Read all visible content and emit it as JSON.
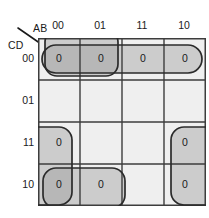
{
  "diagram": {
    "type": "karnaugh-map",
    "size": "4x4",
    "corner": {
      "column_variables": "AB",
      "row_variables": "CD"
    },
    "column_headers": [
      "00",
      "01",
      "11",
      "10"
    ],
    "row_headers": [
      "00",
      "01",
      "11",
      "10"
    ],
    "cells": [
      {
        "row": "00",
        "col": "00",
        "value": "0",
        "shade": "dark"
      },
      {
        "row": "00",
        "col": "01",
        "value": "0",
        "shade": "dark"
      },
      {
        "row": "00",
        "col": "11",
        "value": "0",
        "shade": "light"
      },
      {
        "row": "00",
        "col": "10",
        "value": "0",
        "shade": "light"
      },
      {
        "row": "01",
        "col": "00",
        "value": "",
        "shade": "none"
      },
      {
        "row": "01",
        "col": "01",
        "value": "",
        "shade": "none"
      },
      {
        "row": "01",
        "col": "11",
        "value": "",
        "shade": "none"
      },
      {
        "row": "01",
        "col": "10",
        "value": "",
        "shade": "none"
      },
      {
        "row": "11",
        "col": "00",
        "value": "0",
        "shade": "light"
      },
      {
        "row": "11",
        "col": "01",
        "value": "",
        "shade": "none"
      },
      {
        "row": "11",
        "col": "11",
        "value": "",
        "shade": "none"
      },
      {
        "row": "11",
        "col": "10",
        "value": "0",
        "shade": "light"
      },
      {
        "row": "10",
        "col": "00",
        "value": "0",
        "shade": "dark"
      },
      {
        "row": "10",
        "col": "01",
        "value": "0",
        "shade": "light"
      },
      {
        "row": "10",
        "col": "11",
        "value": "",
        "shade": "none"
      },
      {
        "row": "10",
        "col": "10",
        "value": "0",
        "shade": "light"
      }
    ],
    "groups": [
      {
        "id": "group-row00-all",
        "orientation": "horizontal",
        "row": "00",
        "cols": [
          "00",
          "01",
          "11",
          "10"
        ],
        "size": 4
      },
      {
        "id": "group-row00-left",
        "orientation": "horizontal",
        "row": "00",
        "cols": [
          "00",
          "01"
        ],
        "size": 2
      },
      {
        "id": "group-col00-bottom",
        "orientation": "vertical",
        "col": "00",
        "rows": [
          "11",
          "10"
        ],
        "size": 2,
        "wraps_edge": "left"
      },
      {
        "id": "group-row10-left",
        "orientation": "horizontal",
        "row": "10",
        "cols": [
          "00",
          "01"
        ],
        "size": 2
      },
      {
        "id": "group-col10-bottom",
        "orientation": "vertical",
        "col": "10",
        "rows": [
          "11",
          "10"
        ],
        "size": 2,
        "wraps_edge": "right"
      }
    ],
    "colors": {
      "cell_empty": "#efefef",
      "cell_light": "#d3d3d3",
      "cell_dark": "#b9b9b9",
      "grid_line": "#3d3d3d",
      "group_outline": "#2b2b2b",
      "text": "#1a1a1a",
      "background": "#ffffff"
    }
  }
}
